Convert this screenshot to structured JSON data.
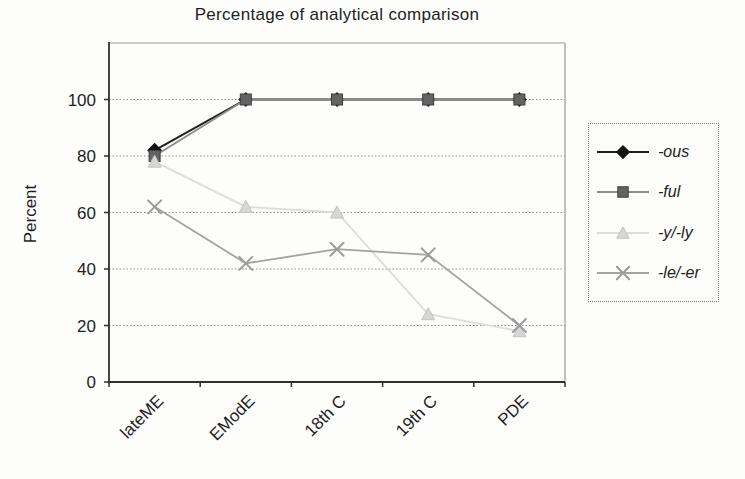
{
  "title": "Percentage of analytical comparison",
  "y_axis": {
    "label": "Percent",
    "tick_labels": [
      "0",
      "20",
      "40",
      "60",
      "80",
      "100"
    ]
  },
  "x_axis": {
    "tick_labels": [
      "lateME",
      "EModE",
      "18th C",
      "19th C",
      "PDE"
    ]
  },
  "legend": {
    "position": "right",
    "labels": [
      "-ous",
      "-ful",
      "-y/-ly",
      "-le/-er"
    ]
  },
  "colors": {
    "grid": "#8f8f8f",
    "frame": "#9a9a9a",
    "axis": "#2f2f2f",
    "text": "#1e1e1e"
  },
  "chart_data": {
    "type": "line",
    "title": "Percentage of analytical comparison",
    "xlabel": "",
    "ylabel": "Percent",
    "categories": [
      "lateME",
      "EModE",
      "18th C",
      "19th C",
      "PDE"
    ],
    "series": [
      {
        "name": "-ous",
        "marker": "diamond",
        "line_color": "#1f1f1f",
        "marker_fill": "#141414",
        "marker_stroke": "#141414",
        "values": [
          82,
          100,
          100,
          100,
          100
        ]
      },
      {
        "name": "-ful",
        "marker": "square",
        "line_color": "#8c8c8c",
        "marker_fill": "#636363",
        "marker_stroke": "#404040",
        "values": [
          80,
          100,
          100,
          100,
          100
        ]
      },
      {
        "name": "-y/-ly",
        "marker": "triangle",
        "line_color": "#dcdcdc",
        "marker_fill": "#d6d6d6",
        "marker_stroke": "#c4c4c4",
        "values": [
          78,
          62,
          60,
          24,
          18
        ]
      },
      {
        "name": "-le/-er",
        "marker": "x",
        "line_color": "#a3a3a3",
        "marker_fill": "#9b9b9b",
        "marker_stroke": "#9b9b9b",
        "values": [
          62,
          42,
          47,
          45,
          20
        ]
      }
    ],
    "ylim": [
      0,
      120
    ],
    "yticks": [
      0,
      20,
      40,
      60,
      80,
      100
    ],
    "grid": true,
    "legend_position": "right"
  }
}
